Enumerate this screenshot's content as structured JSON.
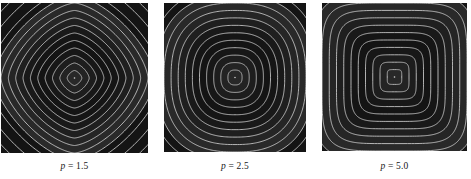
{
  "figure": {
    "background_color": "#ffffff",
    "panel_count": 3
  },
  "panels": [
    {
      "id": "panel-p-1-5",
      "caption_symbol": "p",
      "caption_equation": " = 1.5",
      "caption_full": "p = 1.5",
      "p_value": 1.5
    },
    {
      "id": "panel-p-2-5",
      "caption_symbol": "p",
      "caption_equation": " = 2.5",
      "caption_full": "p = 2.5",
      "p_value": 2.5
    },
    {
      "id": "panel-p-5-0",
      "caption_symbol": "p",
      "caption_equation": " = 5.0",
      "caption_full": "p = 5.0",
      "p_value": 5.0
    }
  ],
  "chart_data": {
    "type": "heatmap",
    "title": "",
    "subtitle": "",
    "xlabel": "",
    "ylabel": "",
    "grid": false,
    "legend": "none",
    "colormap": {
      "fill_dark": "#1b1b1b",
      "fill_mid": "#2a2a2a",
      "contour_line": "#d8d8d8",
      "background": "#ffffff"
    },
    "xlim": [
      -1,
      1
    ],
    "ylim": [
      -1,
      1
    ],
    "contour_levels": [
      0.1,
      0.2,
      0.3,
      0.4,
      0.5,
      0.6,
      0.7,
      0.8,
      0.9,
      1.0,
      1.1
    ],
    "n_contours": 11,
    "panels": [
      {
        "name": "p = 1.5",
        "p": 1.5,
        "function": "(|x|^1.5 + |y|^1.5)^(1/1.5)",
        "level_shape": "rounded diamond",
        "contour_values": [
          0.1,
          0.2,
          0.3,
          0.4,
          0.5,
          0.6,
          0.7,
          0.8,
          0.9,
          1.0,
          1.1
        ]
      },
      {
        "name": "p = 2.5",
        "p": 2.5,
        "function": "(|x|^2.5 + |y|^2.5)^(1/2.5)",
        "level_shape": "near circular / slightly squared",
        "contour_values": [
          0.1,
          0.2,
          0.3,
          0.4,
          0.5,
          0.6,
          0.7,
          0.8,
          0.9,
          1.0,
          1.1
        ]
      },
      {
        "name": "p = 5.0",
        "p": 5.0,
        "function": "(|x|^5 + |y|^5)^(1/5)",
        "level_shape": "rounded square",
        "contour_values": [
          0.1,
          0.2,
          0.3,
          0.4,
          0.5,
          0.6,
          0.7,
          0.8,
          0.9,
          1.0,
          1.1
        ]
      }
    ]
  }
}
